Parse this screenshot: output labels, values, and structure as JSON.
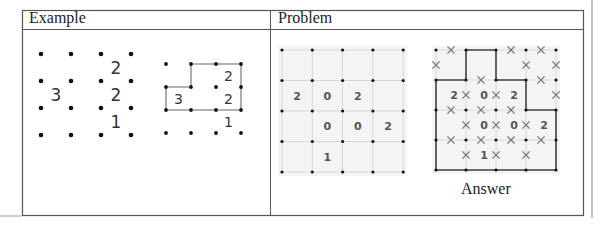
{
  "table": {
    "headers": [
      "Example",
      "Problem"
    ]
  },
  "example": {
    "puzzle": {
      "dot_rows": 4,
      "dot_cols": 4,
      "clues": [
        {
          "row": 0,
          "col": 2,
          "value": "2"
        },
        {
          "row": 1,
          "col": 0,
          "value": "3"
        },
        {
          "row": 1,
          "col": 2,
          "value": "2"
        },
        {
          "row": 2,
          "col": 2,
          "value": "1"
        }
      ]
    },
    "solution": {
      "dot_rows": 4,
      "dot_cols": 4,
      "clues": [
        {
          "row": 0,
          "col": 2,
          "value": "2"
        },
        {
          "row": 1,
          "col": 0,
          "value": "3"
        },
        {
          "row": 1,
          "col": 2,
          "value": "2"
        },
        {
          "row": 2,
          "col": 2,
          "value": "1"
        }
      ],
      "loop": [
        [
          1,
          0
        ],
        [
          1,
          1
        ],
        [
          0,
          1
        ],
        [
          0,
          3
        ],
        [
          2,
          3
        ],
        [
          2,
          0
        ],
        [
          1,
          0
        ]
      ]
    }
  },
  "problem": {
    "puzzle": {
      "dot_rows": 5,
      "dot_cols": 5,
      "clues": [
        {
          "row": 1,
          "col": 0,
          "value": "2"
        },
        {
          "row": 1,
          "col": 1,
          "value": "0"
        },
        {
          "row": 1,
          "col": 2,
          "value": "2"
        },
        {
          "row": 2,
          "col": 1,
          "value": "0"
        },
        {
          "row": 2,
          "col": 2,
          "value": "0"
        },
        {
          "row": 2,
          "col": 3,
          "value": "2"
        },
        {
          "row": 3,
          "col": 1,
          "value": "1"
        }
      ]
    },
    "answer": {
      "caption": "Answer",
      "dot_rows": 5,
      "dot_cols": 5,
      "clues": [
        {
          "row": 1,
          "col": 0,
          "value": "2"
        },
        {
          "row": 1,
          "col": 1,
          "value": "0"
        },
        {
          "row": 1,
          "col": 2,
          "value": "2"
        },
        {
          "row": 2,
          "col": 1,
          "value": "0"
        },
        {
          "row": 2,
          "col": 2,
          "value": "0"
        },
        {
          "row": 2,
          "col": 3,
          "value": "2"
        },
        {
          "row": 3,
          "col": 1,
          "value": "1"
        }
      ],
      "loop": [
        [
          1,
          0
        ],
        [
          1,
          1
        ],
        [
          0,
          1
        ],
        [
          0,
          2
        ],
        [
          1,
          2
        ],
        [
          1,
          3
        ],
        [
          2,
          3
        ],
        [
          2,
          4
        ],
        [
          4,
          4
        ],
        [
          4,
          0
        ],
        [
          1,
          0
        ]
      ],
      "crossed_edges": {
        "horizontal": [
          [
            0,
            0
          ],
          [
            0,
            2
          ],
          [
            0,
            3
          ],
          [
            1,
            1
          ],
          [
            1,
            3
          ],
          [
            2,
            0
          ],
          [
            2,
            1
          ],
          [
            2,
            2
          ],
          [
            3,
            0
          ],
          [
            3,
            1
          ],
          [
            3,
            2
          ],
          [
            3,
            3
          ]
        ],
        "vertical": [
          [
            0,
            0
          ],
          [
            0,
            3
          ],
          [
            0,
            4
          ],
          [
            1,
            1
          ],
          [
            1,
            2
          ],
          [
            1,
            4
          ],
          [
            2,
            1
          ],
          [
            2,
            2
          ],
          [
            2,
            3
          ],
          [
            3,
            1
          ],
          [
            3,
            2
          ],
          [
            3,
            3
          ]
        ]
      }
    }
  },
  "colors": {
    "border": "#555555",
    "grid_bg": "#f4f4f4",
    "grid_line": "#d8d8d8",
    "dot": "#111111",
    "loop_example": "#9a9a9a",
    "loop_answer": "#444444",
    "cross": "#777777",
    "clue_text": "#555555",
    "example_text": "#333333"
  }
}
